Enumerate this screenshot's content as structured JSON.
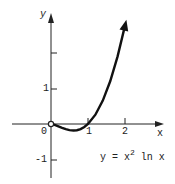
{
  "chart_data": {
    "type": "line",
    "title": "",
    "equation": "y = x^2 ln x",
    "xlabel": "x",
    "ylabel": "y",
    "origin_label": "0",
    "x_ticks": [
      "1",
      "2"
    ],
    "y_ticks": [
      "1",
      "",
      "-1"
    ],
    "y_tick_values": [
      1,
      2,
      -1
    ],
    "xlim": [
      -1,
      2.6
    ],
    "ylim": [
      -1.4,
      3.0
    ],
    "grid": false,
    "series": [
      {
        "name": "y = x^2 ln x",
        "x": [
          0,
          0.1,
          0.2,
          0.3,
          0.4,
          0.5,
          0.607,
          0.7,
          0.8,
          0.9,
          1.0,
          1.2,
          1.4,
          1.6,
          1.8,
          2.0,
          2.1
        ],
        "y": [
          0,
          -0.023,
          -0.064,
          -0.108,
          -0.147,
          -0.173,
          -0.184,
          -0.175,
          -0.143,
          -0.085,
          0,
          0.263,
          0.659,
          1.203,
          1.904,
          2.773,
          3.27
        ]
      }
    ],
    "annotations": [
      "open circle at origin (0,0)",
      "arrow at end of curve"
    ]
  },
  "labels": {
    "y_axis": "y",
    "x_axis": "x",
    "origin": "0",
    "x_tick_1": "1",
    "x_tick_2": "2",
    "y_tick_1": "1",
    "y_tick_neg1": "-1",
    "eq_main": "y = x",
    "eq_sup": "2",
    "eq_tail": "ln x"
  }
}
